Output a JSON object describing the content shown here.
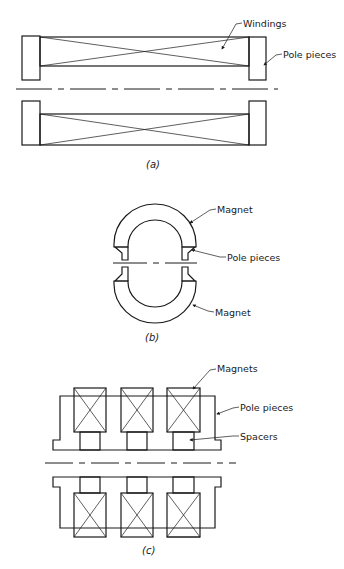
{
  "figure": {
    "panels": [
      {
        "id": "a",
        "caption": "(a)",
        "labels": {
          "windings": "Windings",
          "pole_pieces": "Pole pieces"
        }
      },
      {
        "id": "b",
        "caption": "(b)",
        "labels": {
          "magnet_top": "Magnet",
          "pole_pieces": "Pole pieces",
          "magnet_bottom": "Magnet"
        }
      },
      {
        "id": "c",
        "caption": "(c)",
        "labels": {
          "magnets": "Magnets",
          "pole_pieces": "Pole pieces",
          "spacers": "Spacers"
        }
      }
    ]
  }
}
